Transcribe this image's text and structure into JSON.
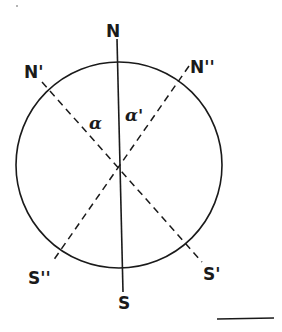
{
  "diagram": {
    "type": "compass-declination-diagram",
    "circle": {
      "cx": 119,
      "cy": 165,
      "r": 103
    },
    "labels": {
      "north": "N",
      "south": "S",
      "north_prime": "N'",
      "north_double_prime": "N''",
      "south_prime": "S'",
      "south_double_prime": "S''",
      "angle_alpha": "α",
      "angle_alpha_prime": "α'"
    },
    "lines": [
      {
        "name": "true-meridian",
        "from": "N",
        "to": "S",
        "style": "solid"
      },
      {
        "name": "magnetic-meridian-1",
        "from": "N'",
        "to": "S'",
        "style": "dashed"
      },
      {
        "name": "magnetic-meridian-2",
        "from": "N''",
        "to": "S''",
        "style": "dashed"
      }
    ],
    "colors": {
      "ink": "#1a1a1a",
      "background": "#ffffff"
    }
  }
}
